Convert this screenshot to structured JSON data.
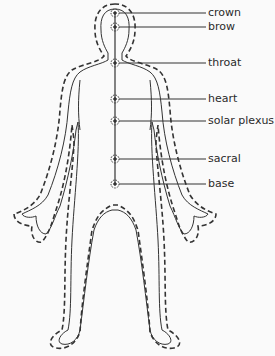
{
  "diagram": {
    "chakras": [
      {
        "label": "crown",
        "y": 13,
        "label_y": 7
      },
      {
        "label": "brow",
        "y": 27,
        "label_y": 21
      },
      {
        "label": "throat",
        "y": 63,
        "label_y": 57
      },
      {
        "label": "heart",
        "y": 99,
        "label_y": 93
      },
      {
        "label": "solar plexus",
        "y": 121,
        "label_y": 116
      },
      {
        "label": "sacral",
        "y": 159,
        "label_y": 154
      },
      {
        "label": "base",
        "y": 184,
        "label_y": 178
      }
    ],
    "colors": {
      "line": "#333333",
      "background": "#fafafa",
      "dot": "#444444"
    }
  }
}
